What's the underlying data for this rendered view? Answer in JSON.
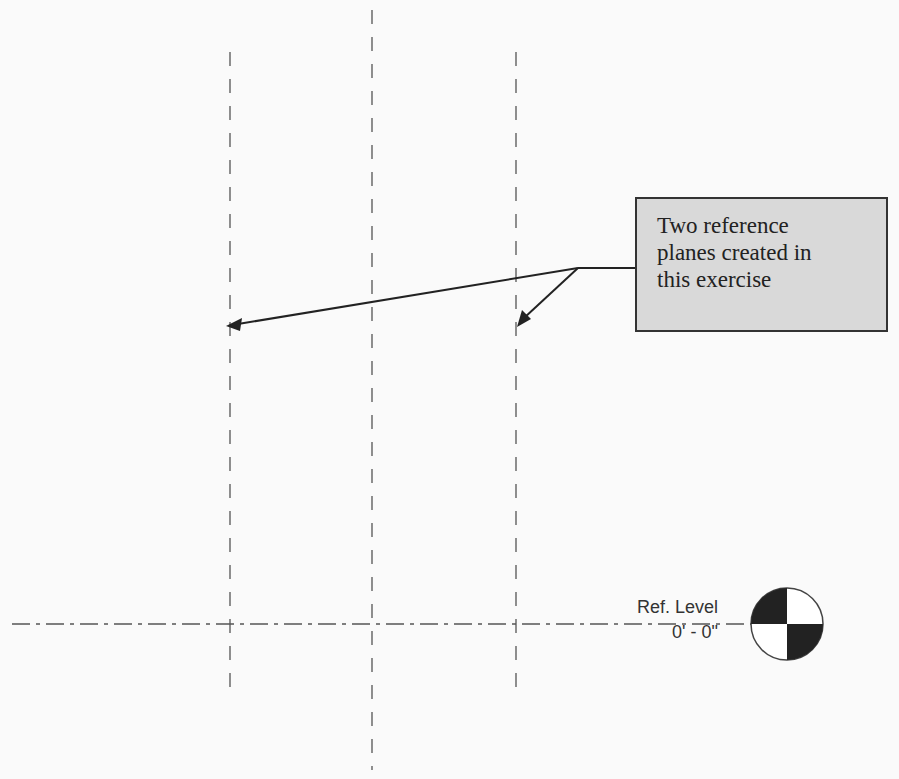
{
  "callout": {
    "lines": [
      "Two reference",
      "planes created in",
      "this exercise"
    ]
  },
  "level": {
    "name": "Ref. Level",
    "elevation": "0' - 0\""
  },
  "colors": {
    "line": "#444444",
    "callout_fill": "#d9d9d9",
    "callout_border": "#333333",
    "background": "#fafafa"
  }
}
